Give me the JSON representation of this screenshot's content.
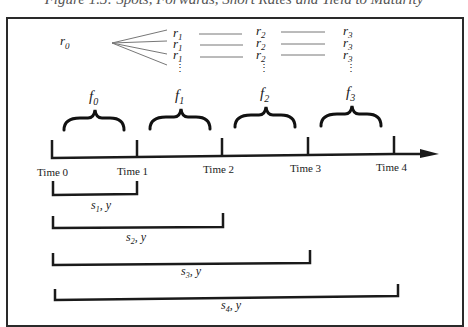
{
  "figure": {
    "title": "Figure 1.3: Spots, Forwards, Short Rates and Yield to Maturity"
  },
  "short_rates": {
    "origin": {
      "sym": "r",
      "sub": "0"
    },
    "columns": [
      {
        "sym": "r",
        "sub": "1",
        "rows": 3
      },
      {
        "sym": "r",
        "sub": "2",
        "rows": 3
      },
      {
        "sym": "r",
        "sub": "3",
        "rows": 3
      }
    ],
    "ellipsis": "⋮"
  },
  "forwards": [
    {
      "sym": "f",
      "sub": "0"
    },
    {
      "sym": "f",
      "sub": "1"
    },
    {
      "sym": "f",
      "sub": "2"
    },
    {
      "sym": "f",
      "sub": "3"
    }
  ],
  "timeline": {
    "ticks": [
      "Time 0",
      "Time 1",
      "Time 2",
      "Time 3",
      "Time 4"
    ]
  },
  "spans": [
    {
      "sym": "s",
      "sub": "1",
      "suffix": ", y"
    },
    {
      "sym": "s",
      "sub": "2",
      "suffix": ", y"
    },
    {
      "sym": "s",
      "sub": "3",
      "suffix": ", y"
    },
    {
      "sym": "s",
      "sub": "4",
      "suffix": ", y"
    }
  ],
  "colors": {
    "line": "#222222",
    "thin": "#777777",
    "text": "#222222"
  }
}
